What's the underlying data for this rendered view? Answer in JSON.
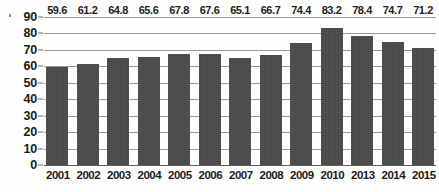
{
  "chart_data": {
    "type": "bar",
    "title": "",
    "xlabel": "",
    "ylabel": "",
    "ylim": [
      0,
      90
    ],
    "ytick_step": 10,
    "yticks": [
      0,
      10,
      20,
      30,
      40,
      50,
      60,
      70,
      80,
      90
    ],
    "grid": true,
    "legend": null,
    "bar_color": "#474747",
    "background_color": "#fdfdfc",
    "axis_text_color": "#1c1c1c",
    "gridline_color": "#9a9a98",
    "categories": [
      "2001",
      "2002",
      "2003",
      "2004",
      "2005",
      "2006",
      "2007",
      "2008",
      "2009",
      "2010",
      "2013",
      "2014",
      "2015"
    ],
    "values": [
      59.6,
      61.2,
      64.8,
      65.6,
      67.8,
      67.6,
      65.1,
      66.7,
      74.4,
      83.2,
      78.4,
      74.7,
      71.2
    ],
    "value_labels": [
      "59.6",
      "61.2",
      "64.8",
      "65.6",
      "67.8",
      "67.6",
      "65.1",
      "66.7",
      "74.4",
      "83.2",
      "78.4",
      "74.7",
      "71.2"
    ]
  },
  "axis": {
    "y_labels": [
      "90",
      "80",
      "70",
      "60",
      "50",
      "40",
      "30",
      "20",
      "10",
      "0"
    ]
  }
}
